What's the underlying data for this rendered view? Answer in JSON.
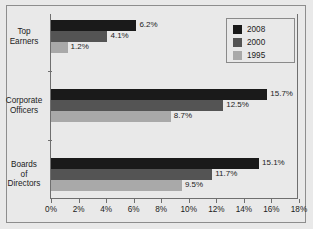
{
  "chart_data": {
    "type": "bar",
    "orientation": "horizontal",
    "title": "",
    "subtitle": "",
    "xlabel": "",
    "ylabel": "",
    "categories": [
      "Top Earners",
      "Corporate Officers",
      "Boards of Directors"
    ],
    "category_label_lines": [
      [
        "Top",
        "Earners"
      ],
      [
        "Corporate",
        "Officers"
      ],
      [
        "Boards",
        "of",
        "Directors"
      ]
    ],
    "series": [
      {
        "name": "2008",
        "color": "#1a1a1a",
        "values": [
          6.2,
          15.7,
          15.1
        ]
      },
      {
        "name": "2000",
        "color": "#545454",
        "values": [
          4.1,
          12.5,
          11.7
        ]
      },
      {
        "name": "1995",
        "color": "#a9a9a9",
        "values": [
          1.2,
          8.7,
          9.5
        ]
      }
    ],
    "value_labels": [
      [
        "6.2%",
        "4.1%",
        "1.2%"
      ],
      [
        "15.7%",
        "12.5%",
        "8.7%"
      ],
      [
        "15.1%",
        "11.7%",
        "9.5%"
      ]
    ],
    "xlim": [
      0,
      18
    ],
    "xticks": [
      0,
      2,
      4,
      6,
      8,
      10,
      12,
      14,
      16,
      18
    ],
    "xtick_labels": [
      "0%",
      "2%",
      "4%",
      "6%",
      "8%",
      "10%",
      "12%",
      "14%",
      "16%",
      "18%"
    ],
    "grid": false,
    "legend_position": "top-right",
    "legend_entries": [
      "2008",
      "2000",
      "1995"
    ],
    "background_color": "#e9e9e9",
    "axis_color": "#6f6f6f",
    "text_color": "#1b1b1b"
  }
}
